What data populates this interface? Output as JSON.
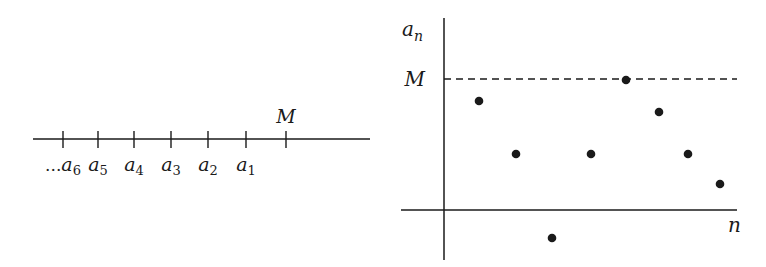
{
  "left_diagram": {
    "description": "Number line with decreasing-index sequence terms bounded above by M",
    "line": {
      "x1": 33,
      "x2": 370,
      "y": 139
    },
    "ticks": [
      {
        "x": 63,
        "label": "a",
        "sub": "6",
        "prefix": "..."
      },
      {
        "x": 98,
        "label": "a",
        "sub": "5",
        "prefix": ""
      },
      {
        "x": 134,
        "label": "a",
        "sub": "4",
        "prefix": ""
      },
      {
        "x": 171,
        "label": "a",
        "sub": "3",
        "prefix": ""
      },
      {
        "x": 208,
        "label": "a",
        "sub": "2",
        "prefix": ""
      },
      {
        "x": 246,
        "label": "a",
        "sub": "1",
        "prefix": ""
      }
    ],
    "bound_tick": {
      "x": 286,
      "label": "M"
    }
  },
  "right_diagram": {
    "description": "Plot of a sequence a_n versus n, bounded above by dashed line M",
    "y_axis_label": {
      "main": "a",
      "sub": "n"
    },
    "x_axis_label": "n",
    "bound_label": "M",
    "origin": {
      "x": 444,
      "y": 210
    },
    "y_axis": {
      "top": 18,
      "bottom": 260
    },
    "x_axis": {
      "left": 401,
      "right": 737
    },
    "bound_line": {
      "y": 79,
      "x1": 444,
      "x2": 737,
      "style": "dashed"
    },
    "points": [
      {
        "x": 479,
        "y": 101
      },
      {
        "x": 516,
        "y": 154
      },
      {
        "x": 552,
        "y": 238
      },
      {
        "x": 591,
        "y": 154
      },
      {
        "x": 626,
        "y": 80
      },
      {
        "x": 659,
        "y": 112
      },
      {
        "x": 688,
        "y": 154
      },
      {
        "x": 720,
        "y": 184
      }
    ]
  },
  "colors": {
    "ink": "#1a1a1a",
    "background": "#ffffff"
  }
}
